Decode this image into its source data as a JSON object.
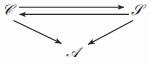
{
  "figure": {
    "kind": "commutative-diagram",
    "background_color": "#fdfdfd",
    "ink_color": "#262626",
    "width": 149,
    "height": 65
  },
  "nodes": [
    {
      "id": "C",
      "label": "𝒞",
      "plain": "C",
      "position": "top-left",
      "x": 10,
      "y": 11
    },
    {
      "id": "S",
      "label": "𝒮",
      "plain": "S",
      "position": "top-right",
      "x": 137,
      "y": 11
    },
    {
      "id": "A",
      "label": "𝒜",
      "plain": "A",
      "position": "bottom-center",
      "x": 74,
      "y": 52
    }
  ],
  "edges": [
    {
      "id": "c-to-s",
      "from": "C",
      "to": "S",
      "label": "",
      "style": "solid",
      "head": "to",
      "orientation": "horizontal-top"
    },
    {
      "id": "s-to-c",
      "from": "S",
      "to": "C",
      "label": "",
      "style": "solid",
      "head": "to",
      "orientation": "horizontal-bottom"
    },
    {
      "id": "c-to-a",
      "from": "C",
      "to": "A",
      "label": "",
      "style": "solid",
      "head": "to",
      "orientation": "diagonal-left"
    },
    {
      "id": "s-to-a",
      "from": "S",
      "to": "A",
      "label": "",
      "style": "solid",
      "head": "to",
      "orientation": "diagonal-right"
    }
  ]
}
